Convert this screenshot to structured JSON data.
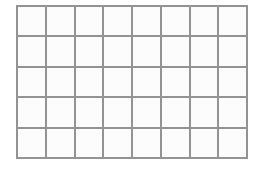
{
  "figure": {
    "kind": "blank-grid",
    "title": "",
    "caption": "",
    "annotations": []
  },
  "canvas": {
    "width_px": 263,
    "height_px": 171,
    "background_color": "#ffffff"
  },
  "grid": {
    "columns": 8,
    "rows": 5,
    "cell_count": 40,
    "left_px": 16,
    "top_px": 5,
    "width_px": 232,
    "height_px": 154,
    "cell_width_px": 28.75,
    "cell_height_px": 30.4,
    "line_color": "#8a8a8a",
    "line_width_px": 2,
    "cell_fill_color": "#fcfcfc",
    "border_color": "#8a8a8a",
    "cells": [
      [
        "",
        "",
        "",
        "",
        "",
        "",
        "",
        ""
      ],
      [
        "",
        "",
        "",
        "",
        "",
        "",
        "",
        ""
      ],
      [
        "",
        "",
        "",
        "",
        "",
        "",
        "",
        ""
      ],
      [
        "",
        "",
        "",
        "",
        "",
        "",
        "",
        ""
      ],
      [
        "",
        "",
        "",
        "",
        "",
        "",
        "",
        ""
      ]
    ]
  }
}
